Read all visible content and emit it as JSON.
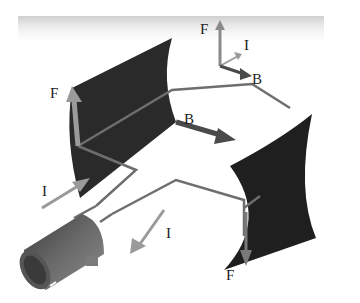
{
  "figure": {
    "colors": {
      "background": "#ffffff",
      "top_band": "#d9d9d9",
      "magnet": "#2a2a2a",
      "wire": "#6e6e6e",
      "force_arrow": "#9a9a9a",
      "current_arrow": "#9a9a9a",
      "field_arrow": "#4a4a4a",
      "commutator": "#5a5a5a"
    }
  },
  "axis_key": {
    "force_label": "F",
    "current_label": "I",
    "field_label": "B"
  },
  "labels": {
    "left_force": "F",
    "field": "B",
    "current_in": "I",
    "current_out": "I",
    "right_force": "F"
  }
}
